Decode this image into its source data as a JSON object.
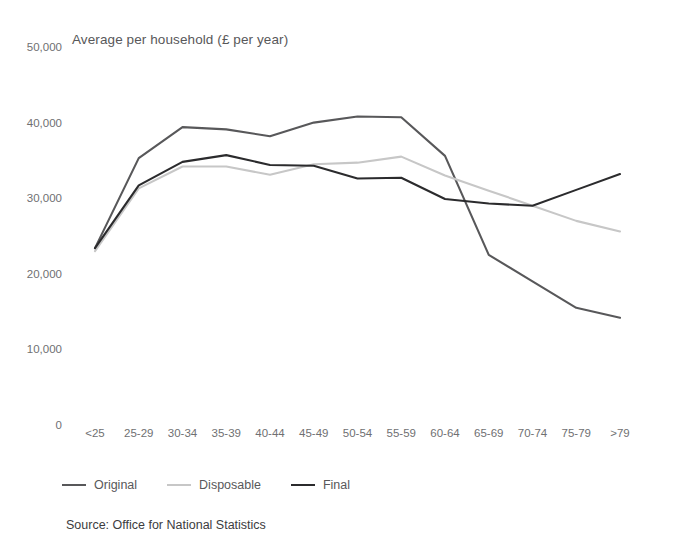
{
  "chart_data": {
    "type": "line",
    "title": "Average per household (£ per year)",
    "subtitle": "",
    "xlabel": "",
    "ylabel": "",
    "source": "Source: Office for National Statistics",
    "grid": false,
    "legend_position": "bottom-left",
    "ylim": [
      0,
      50000
    ],
    "yticks": [
      0,
      10000,
      20000,
      30000,
      40000,
      50000
    ],
    "ytick_labels": [
      "0",
      "10,000",
      "20,000",
      "30,000",
      "40,000",
      "50,000"
    ],
    "categories": [
      "<25",
      "25-29",
      "30-34",
      "35-39",
      "40-44",
      "45-49",
      "50-54",
      "55-59",
      "60-64",
      "65-69",
      "70-74",
      "75-79",
      ">79"
    ],
    "series": [
      {
        "name": "Original",
        "color": "#58585a",
        "values": [
          23400,
          35300,
          39400,
          39100,
          38200,
          40000,
          40800,
          40700,
          35600,
          22500,
          19000,
          15500,
          14200
        ]
      },
      {
        "name": "Disposable",
        "color": "#c7c7c7",
        "values": [
          23000,
          31300,
          34200,
          34200,
          33100,
          34500,
          34700,
          35500,
          33000,
          31000,
          29000,
          27000,
          25600
        ]
      },
      {
        "name": "Final",
        "color": "#2b2b2d",
        "values": [
          23400,
          31700,
          34800,
          35700,
          34400,
          34300,
          32600,
          32700,
          29900,
          29300,
          29000,
          31100,
          33200
        ]
      }
    ]
  },
  "legend": {
    "items": [
      {
        "label": "Original",
        "color": "#58585a"
      },
      {
        "label": "Disposable",
        "color": "#c7c7c7"
      },
      {
        "label": "Final",
        "color": "#2b2b2d"
      }
    ]
  }
}
